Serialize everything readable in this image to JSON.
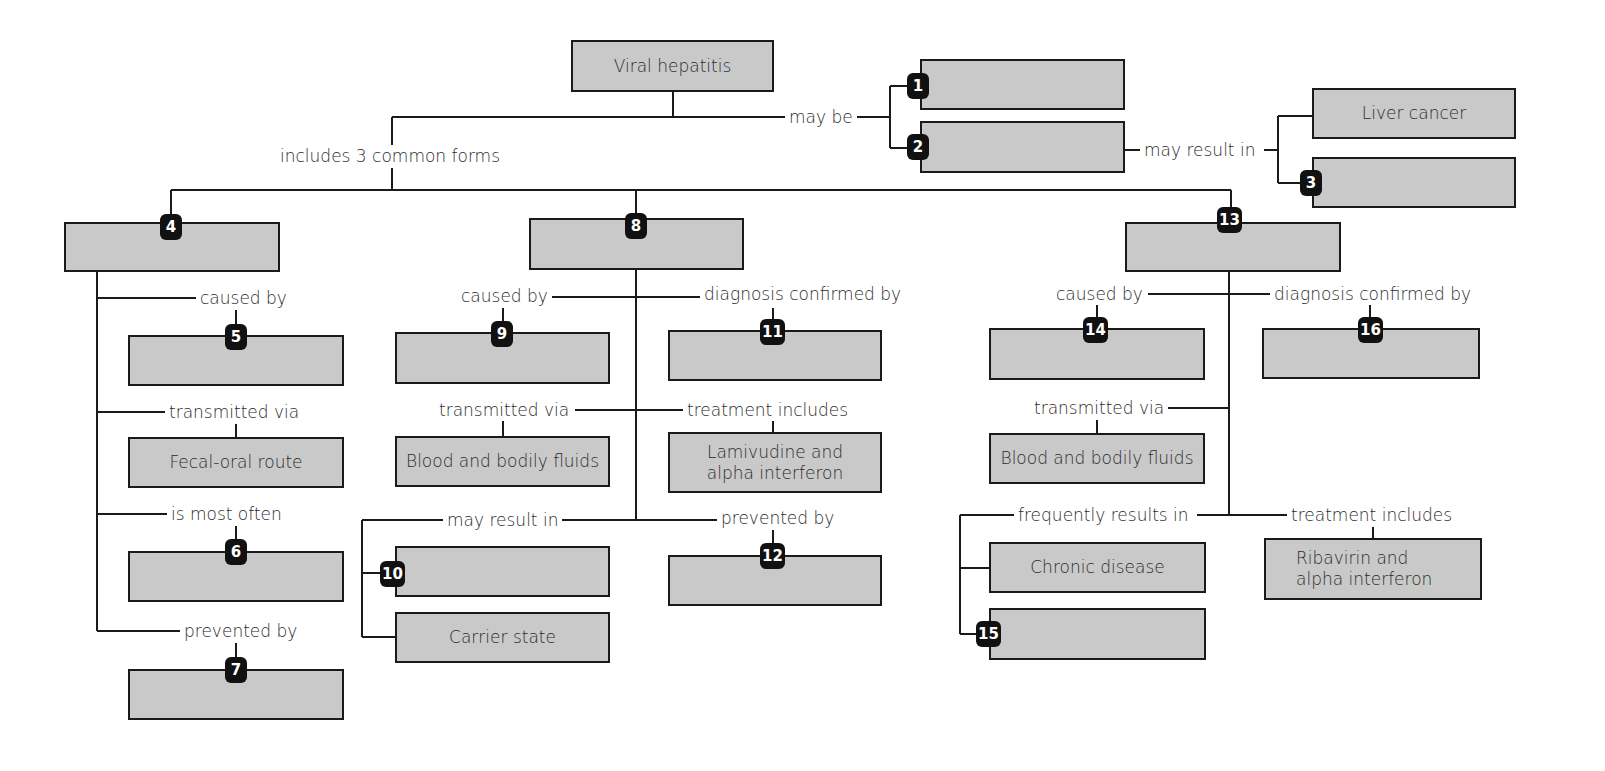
{
  "diagram": {
    "root": {
      "text": "Viral hepatitis"
    },
    "root_links": {
      "may_be": "may be",
      "includes": "includes 3 common forms",
      "may_result_in": "may result in"
    },
    "top_boxes": {
      "liver_cancer": "Liver cancer"
    },
    "forms": {
      "a": {
        "badge": "4",
        "links": {
          "caused_by": "caused by",
          "transmitted_via": "transmitted via",
          "is_most_often": "is most often",
          "prevented_by": "prevented by"
        },
        "boxes": {
          "transmission": "Fecal-oral route"
        }
      },
      "b": {
        "badge": "8",
        "links": {
          "caused_by": "caused by",
          "diagnosis": "diagnosis confirmed by",
          "transmitted_via": "transmitted via",
          "treatment": "treatment includes",
          "may_result_in": "may result in",
          "prevented_by": "prevented by"
        },
        "boxes": {
          "transmission": "Blood and bodily fluids",
          "treatment": "Lamivudine and alpha interferon",
          "carrier": "Carrier state"
        }
      },
      "c": {
        "badge": "13",
        "links": {
          "caused_by": "caused by",
          "diagnosis": "diagnosis confirmed by",
          "transmitted_via": "transmitted via",
          "frequently": "frequently results in",
          "treatment": "treatment includes"
        },
        "boxes": {
          "transmission": "Blood and bodily fluids",
          "chronic": "Chronic disease",
          "treatment": "Ribavirin and alpha interferon"
        }
      }
    },
    "badges": [
      "1",
      "2",
      "3",
      "4",
      "5",
      "6",
      "7",
      "8",
      "9",
      "10",
      "11",
      "12",
      "13",
      "14",
      "15",
      "16"
    ]
  }
}
